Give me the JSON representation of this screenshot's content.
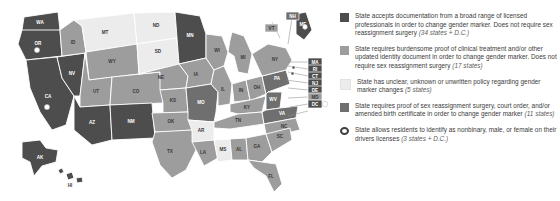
{
  "map": {
    "title": "US state gender marker policy map",
    "colors": {
      "cat1": "#4d4d4d",
      "cat2": "#9d9d9d",
      "cat3": "#ececec",
      "cat4": "#6f6f6f",
      "border": "#ffffff",
      "marker": "#ffffff",
      "leader": "#8d8d8d",
      "background": "#ffffff"
    },
    "states": [
      {
        "code": "WA",
        "category": 1,
        "marker": false
      },
      {
        "code": "OR",
        "category": 1,
        "marker": true
      },
      {
        "code": "CA",
        "category": 1,
        "marker": true
      },
      {
        "code": "NV",
        "category": 1,
        "marker": false
      },
      {
        "code": "ID",
        "category": 2,
        "marker": false
      },
      {
        "code": "MT",
        "category": 3,
        "marker": false
      },
      {
        "code": "WY",
        "category": 2,
        "marker": false
      },
      {
        "code": "UT",
        "category": 2,
        "marker": false
      },
      {
        "code": "AZ",
        "category": 1,
        "marker": false
      },
      {
        "code": "NM",
        "category": 1,
        "marker": false
      },
      {
        "code": "CO",
        "category": 2,
        "marker": false
      },
      {
        "code": "ND",
        "category": 3,
        "marker": false
      },
      {
        "code": "SD",
        "category": 3,
        "marker": false
      },
      {
        "code": "NE",
        "category": 2,
        "marker": false
      },
      {
        "code": "KS",
        "category": 2,
        "marker": false
      },
      {
        "code": "OK",
        "category": 2,
        "marker": false
      },
      {
        "code": "TX",
        "category": 2,
        "marker": false
      },
      {
        "code": "MN",
        "category": 1,
        "marker": false
      },
      {
        "code": "IA",
        "category": 2,
        "marker": false
      },
      {
        "code": "MO",
        "category": 4,
        "marker": false
      },
      {
        "code": "AR",
        "category": 3,
        "marker": false
      },
      {
        "code": "LA",
        "category": 2,
        "marker": false
      },
      {
        "code": "MS",
        "category": 3,
        "marker": false
      },
      {
        "code": "AL",
        "category": 2,
        "marker": false
      },
      {
        "code": "GA",
        "category": 2,
        "marker": false
      },
      {
        "code": "FL",
        "category": 2,
        "marker": false
      },
      {
        "code": "WI",
        "category": 2,
        "marker": false
      },
      {
        "code": "IL",
        "category": 2,
        "marker": false
      },
      {
        "code": "MI",
        "category": 2,
        "marker": false
      },
      {
        "code": "IN",
        "category": 2,
        "marker": false
      },
      {
        "code": "OH",
        "category": 2,
        "marker": false
      },
      {
        "code": "KY",
        "category": 2,
        "marker": false
      },
      {
        "code": "TN",
        "category": 2,
        "marker": false
      },
      {
        "code": "SC",
        "category": 2,
        "marker": false
      },
      {
        "code": "NC",
        "category": 2,
        "marker": false
      },
      {
        "code": "VA",
        "category": 4,
        "marker": false
      },
      {
        "code": "WV",
        "category": 4,
        "marker": false
      },
      {
        "code": "PA",
        "category": 4,
        "marker": false
      },
      {
        "code": "NY",
        "category": 2,
        "marker": false
      },
      {
        "code": "ME",
        "category": 1,
        "marker": true
      },
      {
        "code": "AK",
        "category": 1,
        "marker": false
      },
      {
        "code": "HI",
        "category": 1,
        "marker": false
      }
    ],
    "callouts": [
      {
        "code": "VT",
        "category": 2
      },
      {
        "code": "NH",
        "category": 4
      },
      {
        "code": "MA",
        "category": 1
      },
      {
        "code": "RI",
        "category": 1
      },
      {
        "code": "CT",
        "category": 1
      },
      {
        "code": "NJ",
        "category": 1
      },
      {
        "code": "DE",
        "category": 1
      },
      {
        "code": "MD",
        "category": 2
      },
      {
        "code": "DC",
        "category": 1,
        "marker": true
      }
    ]
  },
  "legend": {
    "items": [
      {
        "swatch": "sw1",
        "icon": "legend-swatch-dark",
        "text": "State accepts documentation from a broad range of licensed professionals in order to change gender marker. Does not require sex reassignment surgery ",
        "count": "(34 states + D.C.)"
      },
      {
        "swatch": "sw2",
        "icon": "legend-swatch-medium",
        "text": "State requires burdensome proof of clinical treatment and/or other updated identity document in order to change gender marker. Does not require sex reassignment surgery ",
        "count": "(17 states)"
      },
      {
        "swatch": "sw3",
        "icon": "legend-swatch-light",
        "text": "State has unclear, unknown or unwritten policy regarding gender marker changes ",
        "count": "(5 states)"
      },
      {
        "swatch": "sw4",
        "icon": "legend-swatch-mid-dark",
        "text": "State requires proof of sex reassignment surgery, court order, and/or amended birth certificate in order to change gender marker ",
        "count": "(11 states)"
      },
      {
        "swatch": "swring",
        "icon": "legend-ring-icon",
        "text": "State allows residents to identify as nonbinary, male, or female on their drivers licenses ",
        "count": "(3 states + D.C.)"
      }
    ]
  }
}
